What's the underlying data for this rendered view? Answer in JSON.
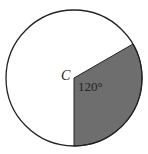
{
  "diagram": {
    "center_label": "C",
    "angle_label": "120°",
    "sector_angle_deg": 120,
    "colors": {
      "sector_fill": "#6e6e6e",
      "stroke": "#222222",
      "background": "#ffffff"
    }
  }
}
